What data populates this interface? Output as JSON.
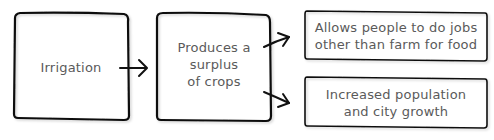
{
  "diagram": {
    "type": "flowchart",
    "nodes": [
      {
        "id": "irrigation",
        "label": "Irrigation"
      },
      {
        "id": "surplus",
        "label": "Produces a\nsurplus\nof crops"
      },
      {
        "id": "jobs",
        "label": "Allows people to do jobs\nother than farm for food"
      },
      {
        "id": "population",
        "label": "Increased population\nand city growth"
      }
    ],
    "edges": [
      {
        "from": "irrigation",
        "to": "surplus"
      },
      {
        "from": "surplus",
        "to": "jobs"
      },
      {
        "from": "surplus",
        "to": "population"
      }
    ],
    "colors": {
      "stroke": "#111111",
      "text": "#5a5a5a",
      "background": "#ffffff"
    }
  }
}
